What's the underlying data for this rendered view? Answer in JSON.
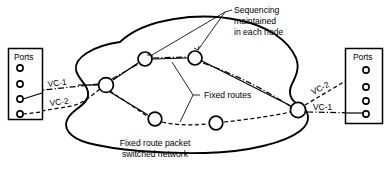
{
  "figure": {
    "background_color": "#ffffff",
    "line_color": "#000000",
    "width": 388,
    "height": 169
  },
  "left_port_block": {
    "label": "Ports",
    "port_count": 4,
    "ports": [
      {
        "index": 1,
        "connected": false,
        "circuit": ""
      },
      {
        "index": 2,
        "connected": false,
        "circuit": ""
      },
      {
        "index": 3,
        "connected": true,
        "circuit": "VC-1"
      },
      {
        "index": 4,
        "connected": true,
        "circuit": "VC-2"
      }
    ]
  },
  "right_port_block": {
    "label": "Ports",
    "port_count": 4,
    "ports": [
      {
        "index": 1,
        "connected": true,
        "circuit": "VC-2"
      },
      {
        "index": 2,
        "connected": false,
        "circuit": ""
      },
      {
        "index": 3,
        "connected": false,
        "circuit": ""
      },
      {
        "index": 4,
        "connected": true,
        "circuit": "VC-1"
      }
    ]
  },
  "circuits": {
    "left": [
      {
        "name": "VC-1",
        "style": "dash-dot"
      },
      {
        "name": "VC-2",
        "style": "dashed"
      }
    ],
    "right": [
      {
        "name": "VC-2",
        "style": "dashed"
      },
      {
        "name": "VC-1",
        "style": "dash-dot"
      }
    ]
  },
  "annotations": {
    "sequencing": {
      "lines": [
        "Sequencing",
        "maintained",
        "in each node"
      ],
      "leader_targets": [
        "node-top-left",
        "node-top-right"
      ]
    },
    "fixed_routes": {
      "text": "Fixed routes",
      "leader_targets": [
        "route-upper",
        "route-lower"
      ]
    },
    "caption": {
      "lines": [
        "Fixed route packet",
        "switched network"
      ]
    }
  },
  "network": {
    "name": "Fixed route packet switched network",
    "node_count": 6,
    "nodes": [
      {
        "id": "node-left",
        "label": ""
      },
      {
        "id": "node-top-left",
        "label": ""
      },
      {
        "id": "node-top-right",
        "label": ""
      },
      {
        "id": "node-bottom-left",
        "label": ""
      },
      {
        "id": "node-bottom-right",
        "label": ""
      },
      {
        "id": "node-right",
        "label": ""
      }
    ]
  }
}
